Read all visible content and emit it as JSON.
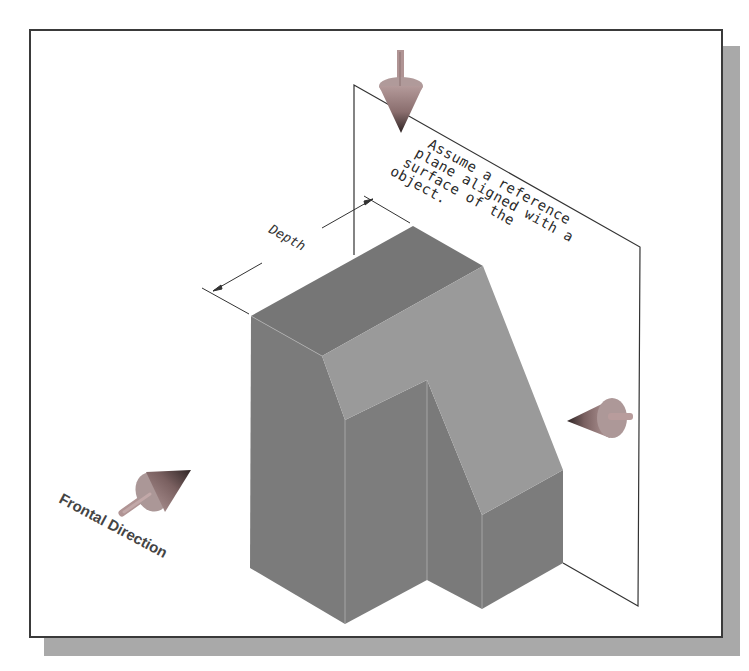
{
  "figure": {
    "type": "isometric-technical-illustration",
    "annotation": {
      "lines": [
        "Assume a reference",
        "plane aligned with a",
        "surface of the",
        "object."
      ]
    },
    "dimension": {
      "label": "Depth"
    },
    "direction_label": "Frontal Direction",
    "arrows": [
      {
        "name": "top-view-arrow",
        "direction": "down"
      },
      {
        "name": "side-view-arrow",
        "direction": "left"
      },
      {
        "name": "frontal-view-arrow",
        "direction": "up-right"
      }
    ],
    "colors": {
      "frame_border": "#3a3a3a",
      "shadow": "#a9a9a9",
      "block_dark": "#7b7b7b",
      "block_top": "#767676",
      "block_slant": "#9a9a9a",
      "arrow_body": "#a88c8c",
      "arrow_tip": "#3a3030"
    }
  }
}
